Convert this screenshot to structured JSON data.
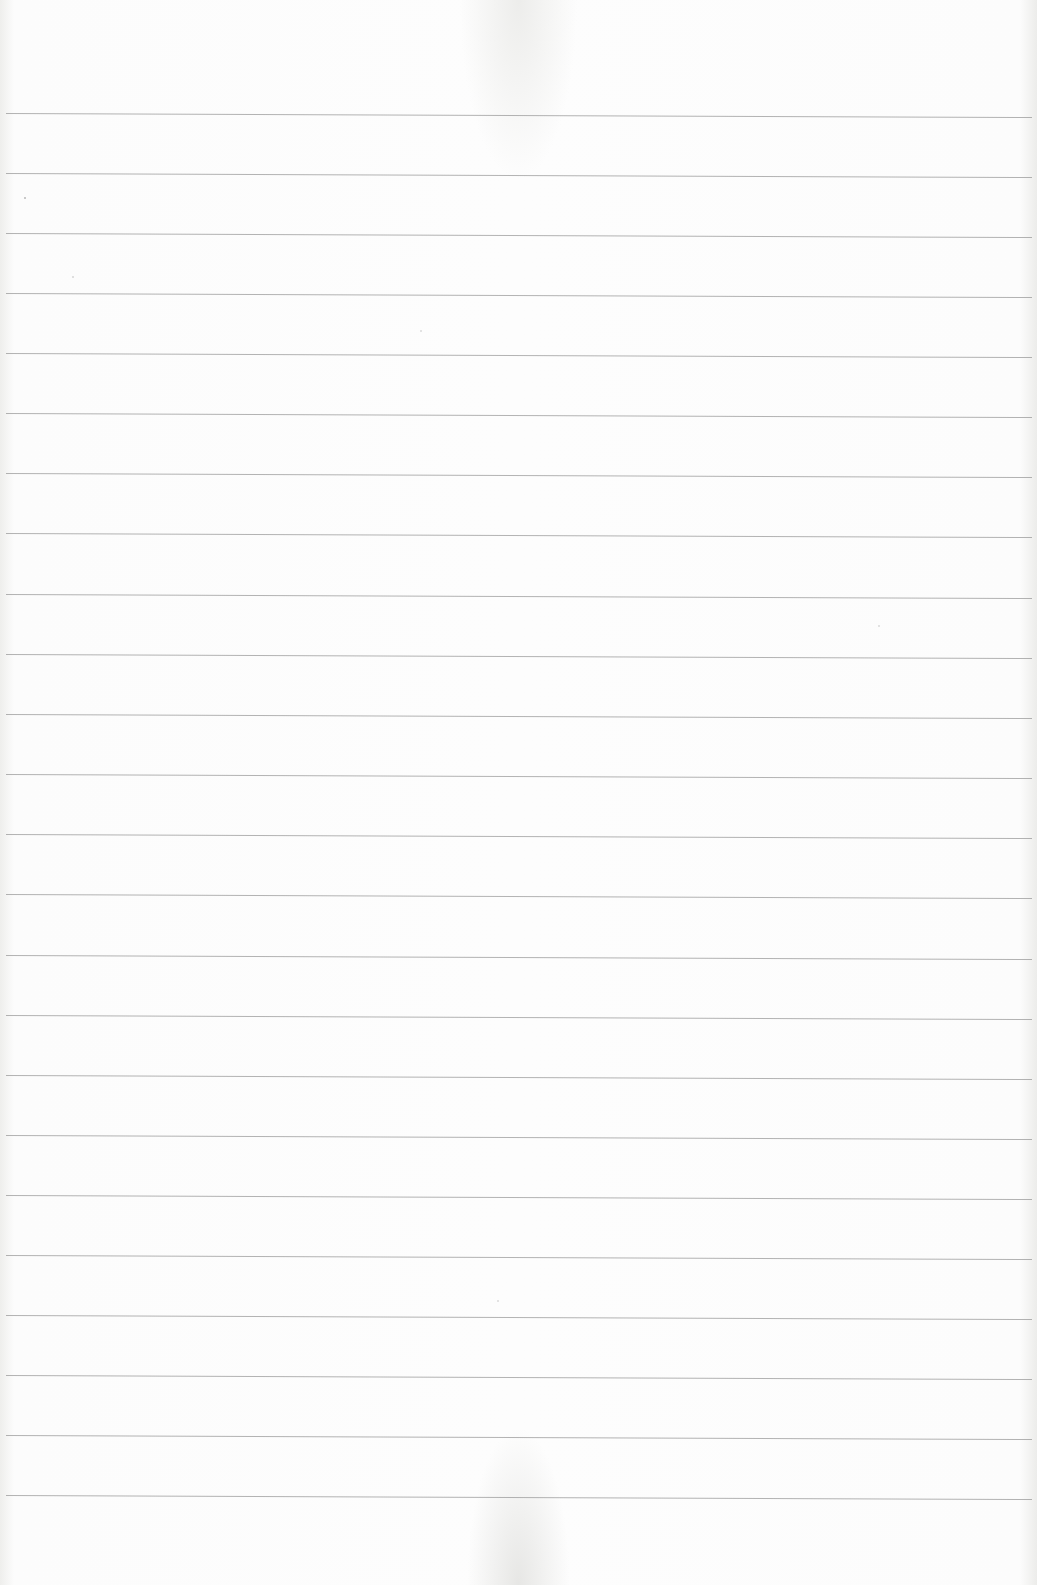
{
  "document": {
    "type": "lined-paper",
    "content_text": "",
    "rule_line_count": 24,
    "rule_line_color": "#9a9a9a",
    "paper_color": "#fdfdfd",
    "rule_positions_y": [
      113,
      173,
      233,
      293,
      353,
      413,
      473,
      533,
      594,
      654,
      714,
      774,
      834,
      894,
      955,
      1015,
      1075,
      1135,
      1195,
      1255,
      1315,
      1375,
      1435,
      1495
    ]
  }
}
